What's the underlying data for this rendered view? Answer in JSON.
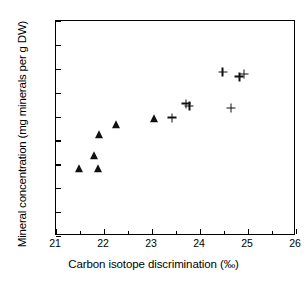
{
  "figure": {
    "x_axis_title": "Carbon isotope discrimination (‰)",
    "y_axis_title": "Mineral concentration (mg minerals per g DW)"
  },
  "chart_data": {
    "type": "scatter",
    "title": "",
    "xlabel": "Carbon isotope discrimination (‰)",
    "ylabel": "Mineral concentration (mg minerals per g DW)",
    "xlim": [
      21,
      26
    ],
    "ylim": [
      30,
      120
    ],
    "xticks": [
      21,
      22,
      23,
      24,
      25,
      26
    ],
    "xtick_labels": [
      "21",
      "22",
      "23",
      "24",
      "25",
      "26"
    ],
    "x_minor_ticks": [
      21.5,
      22.5,
      23.5,
      24.5,
      25.5
    ],
    "yticks": [
      30,
      40,
      50,
      60,
      70,
      80,
      90,
      100,
      110,
      120
    ],
    "ytick_labels": [
      "30",
      "40",
      "50",
      "60",
      "70",
      "80",
      "90",
      "100",
      "110",
      "120"
    ],
    "grid": false,
    "legend": null,
    "series": [
      {
        "name": "triangle-series",
        "marker": "triangle",
        "color": "#111111",
        "points": [
          {
            "x": 21.47,
            "y": 58.1
          },
          {
            "x": 21.8,
            "y": 63.5
          },
          {
            "x": 21.88,
            "y": 58.1
          },
          {
            "x": 21.9,
            "y": 72.3
          },
          {
            "x": 22.24,
            "y": 76.4
          },
          {
            "x": 23.04,
            "y": 78.9
          }
        ]
      },
      {
        "name": "plus-series",
        "marker": "plus",
        "color": "#111111",
        "points": [
          {
            "x": 23.42,
            "y": 79.5
          },
          {
            "x": 23.71,
            "y": 85.4
          },
          {
            "x": 23.78,
            "y": 84.3
          },
          {
            "x": 24.47,
            "y": 98.6
          },
          {
            "x": 24.65,
            "y": 83.5
          },
          {
            "x": 24.82,
            "y": 96.6
          },
          {
            "x": 24.92,
            "y": 97.7
          }
        ]
      }
    ]
  }
}
